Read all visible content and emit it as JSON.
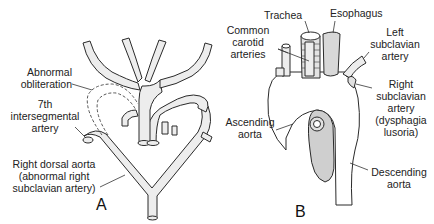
{
  "figure": {
    "panels": [
      {
        "id": "A",
        "letter": "A",
        "labels": {
          "abnormal_obliteration": [
            "Abnormal",
            "obliteration"
          ],
          "seventh_intersegmental": [
            "7th",
            "intersegmental",
            "artery"
          ],
          "right_dorsal_aorta": [
            "Right dorsal aorta",
            "(abnormal right",
            "subclavian artery)"
          ]
        }
      },
      {
        "id": "B",
        "letter": "B",
        "labels": {
          "trachea": "Trachea",
          "esophagus": "Esophagus",
          "common_carotid": [
            "Common",
            "carotid",
            "arteries"
          ],
          "left_subclavian": [
            "Left",
            "subclavian",
            "artery"
          ],
          "right_subclavian": [
            "Right",
            "subclavian",
            "artery",
            "(dysphagia",
            "lusoria)"
          ],
          "ascending_aorta": [
            "Ascending",
            "aorta"
          ],
          "descending_aorta": [
            "Descending",
            "aorta"
          ]
        }
      }
    ],
    "colors": {
      "vessel_fill": "#ededed",
      "outline": "#2a2a2a",
      "background": "#ffffff"
    }
  }
}
